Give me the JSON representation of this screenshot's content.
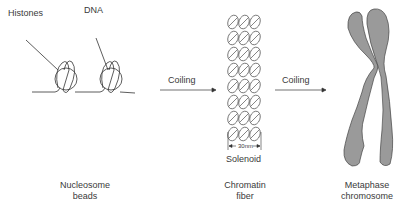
{
  "labels": {
    "histones": "Histones",
    "dna": "DNA",
    "coiling_1": "Coiling",
    "coiling_2": "Coiling",
    "width_30nm": "30nm",
    "solenoid": "Solenoid",
    "nucleosome_line1": "Nucleosome",
    "nucleosome_line2": "beads",
    "chromatin_line1": "Chromatin",
    "chromatin_line2": "fiber",
    "metaphase_line1": "Metaphase",
    "metaphase_line2": "chromosome"
  },
  "colors": {
    "line": "#333333",
    "chromosome_fill": "#9a9a9a",
    "background": "#ffffff"
  }
}
